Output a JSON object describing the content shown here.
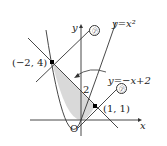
{
  "diagram": {
    "axes": {
      "x_label": "x",
      "y_label": "y",
      "origin_label": "O"
    },
    "curves": [
      {
        "id": "parabola",
        "label": "y=x²",
        "equation": "y = x^2"
      },
      {
        "id": "line",
        "label": "y=−x+2",
        "equation": "y = -x + 2"
      },
      {
        "id": "tangent",
        "label": "㋐",
        "note": "line marked ㋐ through (-2,4) and (1,1) region"
      }
    ],
    "points": [
      {
        "label": "(−2, 4)",
        "x": -2,
        "y": 4
      },
      {
        "label": "(1, 1)",
        "x": 1,
        "y": 1
      }
    ],
    "y_intercept_label": "2",
    "markers": [
      "㋐",
      "㋐"
    ],
    "shaded_region": "between y=x² and y=−x+2 from x=−2 to x=1",
    "colors": {
      "stroke": "#333333",
      "shade": "#d9d9d9",
      "background": "#ffffff"
    }
  }
}
